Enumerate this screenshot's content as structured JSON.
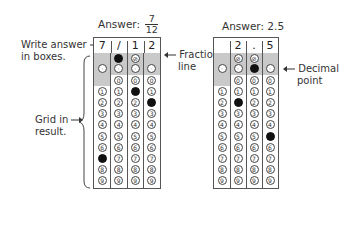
{
  "left_example": {
    "title_prefix": "Answer:",
    "fraction_numerator": "7",
    "fraction_denominator": "12",
    "answer_boxes": [
      "7",
      "/",
      "1",
      "2"
    ],
    "filled": {
      "slash_col": 1,
      "digit_marks": [
        {
          "col": 0,
          "digit": 7
        },
        {
          "col": 2,
          "digit": 1
        },
        {
          "col": 3,
          "digit": 2
        }
      ]
    },
    "annotations": {
      "write_answer": "Write answer",
      "in_boxes": "in boxes.",
      "fraction": "Fraction",
      "line": "line",
      "grid_in": "Grid in",
      "result": "result."
    }
  },
  "right_example": {
    "title": "Answer: 2.5",
    "answer_boxes": [
      "",
      "2",
      ".",
      "5"
    ],
    "filled": {
      "decimal_col": 2,
      "digit_marks": [
        {
          "col": 1,
          "digit": 2
        },
        {
          "col": 3,
          "digit": 5
        }
      ]
    },
    "annotations": {
      "decimal": "Decimal",
      "point": "point"
    }
  },
  "bubble_labels": {
    "slash": "⊘",
    "decimal": "·",
    "digits": [
      "0",
      "1",
      "2",
      "3",
      "4",
      "5",
      "6",
      "7",
      "8",
      "9"
    ]
  }
}
